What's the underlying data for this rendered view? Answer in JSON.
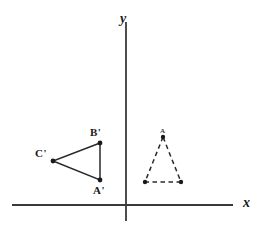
{
  "figure": {
    "background_color": "#ffffff",
    "stroke_color": "#2a2a2a",
    "axis_color": "#3a3a3a",
    "width": 269,
    "height": 230
  },
  "axes": {
    "x_axis": {
      "label": "x",
      "label_x": 243,
      "label_y": 196,
      "x1": 12,
      "y1": 205,
      "x2": 233,
      "y2": 205
    },
    "y_axis": {
      "label": "y",
      "label_x": 120,
      "label_y": 12,
      "x1": 126,
      "y1": 22,
      "x2": 126,
      "y2": 221
    },
    "origin": {
      "x": 126,
      "y": 205
    }
  },
  "shapes": [
    {
      "id": "image-triangle",
      "name": "triangle-a-prime-b-prime-c-prime",
      "style": "solid",
      "points": "100,143 53,161 100,180",
      "vertices": [
        {
          "label": "A'",
          "x": 100,
          "y": 180,
          "label_x": 93,
          "label_y": 185
        },
        {
          "label": "B'",
          "x": 100,
          "y": 143,
          "label_x": 90,
          "label_y": 127
        },
        {
          "label": "C'",
          "x": 53,
          "y": 161,
          "label_x": 35,
          "label_y": 148
        }
      ]
    },
    {
      "id": "preimage-triangle",
      "name": "triangle-preimage-dashed",
      "style": "dashed",
      "points": "163,137 145,182 181,182",
      "apex_mark": "A",
      "apex_mark_x": 160,
      "apex_mark_y": 128,
      "vertices": [
        {
          "label": "",
          "x": 163,
          "y": 137
        },
        {
          "label": "",
          "x": 145,
          "y": 182
        },
        {
          "label": "",
          "x": 181,
          "y": 182
        }
      ]
    }
  ]
}
